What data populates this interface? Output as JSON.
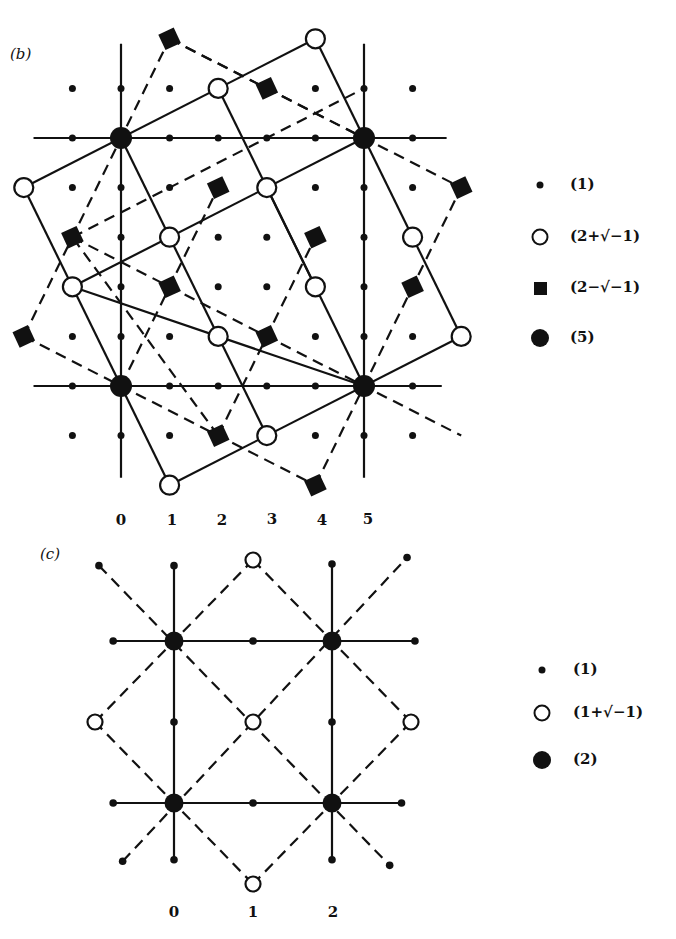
{
  "panel_b": {
    "label": "(b)",
    "origin_px": [
      121,
      386
    ],
    "unit_px": [
      48.6,
      49.6
    ],
    "big_nodes": [
      [
        0,
        0
      ],
      [
        5,
        0
      ],
      [
        0,
        5
      ],
      [
        5,
        5
      ]
    ],
    "open_circles": [
      [
        1,
        -2
      ],
      [
        3,
        -1
      ],
      [
        -1,
        2
      ],
      [
        1,
        3
      ],
      [
        2,
        6
      ],
      [
        4,
        7
      ],
      [
        -2,
        4
      ],
      [
        3,
        4
      ],
      [
        4,
        2
      ],
      [
        2,
        1
      ],
      [
        6,
        3
      ],
      [
        7,
        1
      ]
    ],
    "squares": [
      [
        1,
        7
      ],
      [
        3,
        6
      ],
      [
        2,
        4
      ],
      [
        -1,
        3
      ],
      [
        1,
        2
      ],
      [
        4,
        3
      ],
      [
        7,
        4
      ],
      [
        6,
        2
      ],
      [
        -2,
        1
      ],
      [
        3,
        1
      ],
      [
        2,
        -1
      ],
      [
        4,
        -2
      ]
    ],
    "dot_range": {
      "x": [
        -1,
        6
      ],
      "y": [
        -1,
        6
      ]
    },
    "grid_lines": [
      [
        [
          -1.8,
          0
        ],
        [
          6.6,
          0
        ]
      ],
      [
        [
          -1.8,
          5
        ],
        [
          6.7,
          5
        ]
      ],
      [
        [
          0,
          -1.85
        ],
        [
          0,
          6.9
        ]
      ],
      [
        [
          5,
          -1.85
        ],
        [
          5,
          6.9
        ]
      ]
    ],
    "solid_lines": [
      [
        [
          1,
          -2
        ],
        [
          7,
          1
        ]
      ],
      [
        [
          -1,
          2
        ],
        [
          5,
          5
        ]
      ],
      [
        [
          -2,
          4
        ],
        [
          4,
          7
        ]
      ],
      [
        [
          1,
          -2
        ],
        [
          -2,
          4
        ]
      ],
      [
        [
          3,
          -1
        ],
        [
          0,
          5
        ]
      ],
      [
        [
          4,
          2
        ],
        [
          2,
          6
        ]
      ],
      [
        [
          7,
          1
        ],
        [
          4,
          7
        ]
      ],
      [
        [
          5,
          0
        ],
        [
          -1,
          2
        ]
      ],
      [
        [
          5,
          0
        ],
        [
          3,
          4
        ]
      ]
    ],
    "dashed_lines": [
      [
        [
          -2,
          1
        ],
        [
          4,
          -2
        ]
      ],
      [
        [
          -1,
          3
        ],
        [
          7,
          -1
        ]
      ],
      [
        [
          1,
          7
        ],
        [
          5,
          5
        ]
      ],
      [
        [
          1,
          7
        ],
        [
          7,
          4
        ]
      ],
      [
        [
          -2,
          1
        ],
        [
          1,
          7
        ]
      ],
      [
        [
          2,
          -1
        ],
        [
          4,
          3
        ]
      ],
      [
        [
          4,
          -2
        ],
        [
          7,
          4
        ]
      ],
      [
        [
          -1,
          3
        ],
        [
          5,
          6
        ]
      ],
      [
        [
          0,
          0
        ],
        [
          2,
          4
        ]
      ],
      [
        [
          2,
          -1
        ],
        [
          -1,
          3
        ]
      ]
    ],
    "x_axis_labels": [
      "0",
      "1",
      "2",
      "3",
      "4",
      "5"
    ],
    "x_axis_label_px": [
      [
        121,
        522
      ],
      [
        172,
        522
      ],
      [
        222,
        522
      ],
      [
        272,
        521
      ],
      [
        322,
        522
      ],
      [
        368,
        521
      ]
    ]
  },
  "legend_b": [
    {
      "symbol": "small-dot",
      "text": "(1)"
    },
    {
      "symbol": "open-circle",
      "text": "(2+√−1)"
    },
    {
      "symbol": "filled-square",
      "text": "(2−√−1)"
    },
    {
      "symbol": "big-dot",
      "text": "(5)"
    }
  ],
  "panel_c": {
    "label": "(c)",
    "origin_px": [
      174,
      803
    ],
    "unit_px": [
      79,
      81
    ],
    "big_nodes": [
      [
        0,
        0
      ],
      [
        2,
        0
      ],
      [
        0,
        2
      ],
      [
        2,
        2
      ]
    ],
    "open_circles": [
      [
        1,
        1
      ],
      [
        -1,
        1
      ],
      [
        3,
        1
      ],
      [
        1,
        3
      ],
      [
        1,
        -1
      ]
    ],
    "dots": [
      [
        1,
        0
      ],
      [
        1,
        2
      ],
      [
        0,
        1
      ],
      [
        2,
        1
      ],
      [
        -0.77,
        0
      ],
      [
        2.88,
        0
      ],
      [
        -0.77,
        2
      ],
      [
        3.05,
        2
      ],
      [
        0,
        -0.7
      ],
      [
        2,
        -0.7
      ],
      [
        0,
        2.93
      ],
      [
        2,
        2.95
      ],
      [
        -0.95,
        2.93
      ],
      [
        2.95,
        3.03
      ],
      [
        -0.65,
        -0.72
      ],
      [
        2.73,
        -0.77
      ]
    ],
    "solid_lines": [
      [
        [
          -0.77,
          0
        ],
        [
          2.88,
          0
        ]
      ],
      [
        [
          -0.77,
          2
        ],
        [
          3.05,
          2
        ]
      ],
      [
        [
          0,
          -0.7
        ],
        [
          0,
          2.93
        ]
      ],
      [
        [
          2,
          -0.7
        ],
        [
          2,
          2.95
        ]
      ]
    ],
    "dashed_lines": [
      [
        [
          -0.95,
          2.93
        ],
        [
          2.73,
          -0.77
        ]
      ],
      [
        [
          -0.65,
          -0.72
        ],
        [
          2.95,
          3.03
        ]
      ],
      [
        [
          -1,
          1
        ],
        [
          1,
          3
        ]
      ],
      [
        [
          1,
          3
        ],
        [
          3,
          1
        ]
      ],
      [
        [
          3,
          1
        ],
        [
          1,
          -1
        ]
      ],
      [
        [
          1,
          -1
        ],
        [
          -1,
          1
        ]
      ]
    ],
    "x_axis_labels": [
      "0",
      "1",
      "2"
    ],
    "x_axis_label_px": [
      [
        174,
        914
      ],
      [
        253,
        914
      ],
      [
        333,
        914
      ]
    ]
  },
  "legend_c": [
    {
      "symbol": "small-dot",
      "text": "(1)"
    },
    {
      "symbol": "open-circle",
      "text": "(1+√−1)"
    },
    {
      "symbol": "big-dot",
      "text": "(2)"
    }
  ],
  "colors": {
    "ink": "#111111",
    "background": "#ffffff"
  }
}
